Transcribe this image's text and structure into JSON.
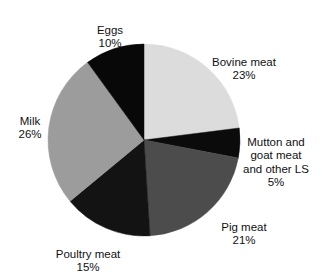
{
  "chart_data": {
    "type": "pie",
    "title": "",
    "subtitle": "",
    "xlabel": "",
    "ylabel": "",
    "legend_position": "none",
    "grid": false,
    "start_angle_deg": 0,
    "direction": "clockwise",
    "categories": [
      "Bovine meat",
      "Mutton and goat meat and other LS",
      "Pig meat",
      "Poultry meat",
      "Milk",
      "Eggs"
    ],
    "values": [
      23,
      5,
      21,
      15,
      26,
      10
    ],
    "unit": "%",
    "slices": [
      {
        "label": "Bovine meat",
        "label_lines": "Bovine meat",
        "value": 23,
        "value_text": "23%",
        "color": "#dcdcdc"
      },
      {
        "label": "Mutton and goat meat and other LS",
        "label_lines": "Mutton and\ngoat meat\nand other LS",
        "value": 5,
        "value_text": "5%",
        "color": "#0b0b0b"
      },
      {
        "label": "Pig meat",
        "label_lines": "Pig meat",
        "value": 21,
        "value_text": "21%",
        "color": "#4c4c4c"
      },
      {
        "label": "Poultry meat",
        "label_lines": "Poultry meat",
        "value": 15,
        "value_text": "15%",
        "color": "#131313"
      },
      {
        "label": "Milk",
        "label_lines": "Milk",
        "value": 26,
        "value_text": "26%",
        "color": "#9c9c9c"
      },
      {
        "label": "Eggs",
        "label_lines": "Eggs",
        "value": 10,
        "value_text": "10%",
        "color": "#080808"
      }
    ],
    "geometry": {
      "center_x": 144,
      "center_y": 140,
      "radius": 96
    },
    "background_color": "#ffffff",
    "text_color": "#111111"
  }
}
